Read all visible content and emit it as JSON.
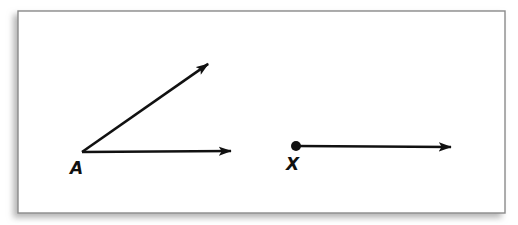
{
  "figure": {
    "background_color": "#ffffff",
    "frame": {
      "name": "figure-frame",
      "x": 18,
      "y": 11,
      "width": 487,
      "height": 202,
      "fill": "#ffffff",
      "stroke": "#8a8a8a",
      "stroke_width": 1.4,
      "shadow_color": "#bdbdbd"
    },
    "ink_color": "#111111",
    "line_width": 2.6
  },
  "shapes": {
    "angle_a": {
      "name": "angle-at-vertex-a",
      "vertex_label": "A",
      "vertex": {
        "x": 82,
        "y": 152
      },
      "label_position": {
        "x": 70,
        "y": 174
      },
      "rays": [
        {
          "name": "ray-a-horizontal",
          "from": {
            "x": 82,
            "y": 152
          },
          "to": {
            "x": 243,
            "y": 151
          }
        },
        {
          "name": "ray-a-diagonal",
          "from": {
            "x": 82,
            "y": 152
          },
          "to": {
            "x": 218,
            "y": 57
          }
        }
      ]
    },
    "ray_x": {
      "name": "ray-from-point-x",
      "endpoint_label": "X",
      "endpoint": {
        "x": 296,
        "y": 146
      },
      "endpoint_dot_radius": 5,
      "label_position": {
        "x": 286,
        "y": 170
      },
      "rays": [
        {
          "name": "ray-x-horizontal",
          "from": {
            "x": 296,
            "y": 146
          },
          "to": {
            "x": 463,
            "y": 147
          }
        }
      ]
    }
  },
  "labels": {
    "a": "A",
    "x": "X"
  },
  "arrowhead": {
    "name": "arrowhead-marker",
    "length": 13,
    "half_width": 4.6
  }
}
